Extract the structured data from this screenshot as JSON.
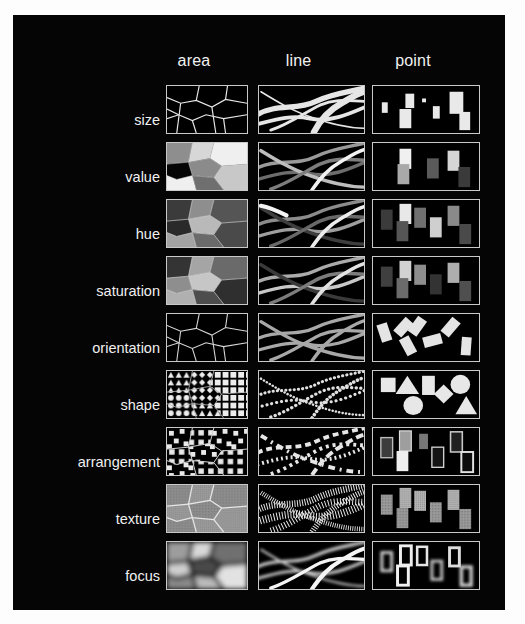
{
  "figure": {
    "background_color": "#ffffff",
    "board_color": "#050505",
    "border_color": "#c9c9c9",
    "text_color": "#f2f2f2"
  },
  "columns": [
    {
      "key": "area",
      "label": "area"
    },
    {
      "key": "line",
      "label": "line"
    },
    {
      "key": "point",
      "label": "point"
    }
  ],
  "rows": [
    {
      "key": "size",
      "label": "size"
    },
    {
      "key": "value",
      "label": "value"
    },
    {
      "key": "hue",
      "label": "hue"
    },
    {
      "key": "saturation",
      "label": "saturation"
    },
    {
      "key": "orientation",
      "label": "orientation"
    },
    {
      "key": "shape",
      "label": "shape"
    },
    {
      "key": "arrangement",
      "label": "arrangement"
    },
    {
      "key": "texture",
      "label": "texture"
    },
    {
      "key": "focus",
      "label": "focus"
    }
  ],
  "matrix": {
    "size": {
      "area": "irregular polygon mesh outlined in white on black, cells of differing sizes",
      "line": "crossing white ribbons of varying thickness",
      "point": "white rectangles of varying size scattered on black"
    },
    "value": {
      "area": "polygon mesh filled with light, mid and dark grey tones",
      "line": "crossing ribbons in light grey, mid grey and white",
      "point": "rectangles in white, light grey, mid grey and dark grey"
    },
    "hue": {
      "area": "polygon mesh filled with different hues rendered as greys",
      "line": "crossing ribbons in different hues rendered as greys",
      "point": "rectangles in different hues rendered as greys"
    },
    "saturation": {
      "area": "polygon mesh filled with varying saturation of one hue",
      "line": "crossing ribbons with varying saturation",
      "point": "rectangles with varying saturation"
    },
    "orientation": {
      "area": "polygon mesh with uniform light outlines",
      "line": "crossing grey ribbons of uniform width",
      "point": "identical light rectangles rotated to different angles"
    },
    "shape": {
      "area": "polygon mesh filled with repeating triangle, circle, diamond and square fill symbols",
      "line": "lines built from repeating small symbol markers",
      "point": "square, triangle, rectangle, circle, diamond shapes"
    },
    "arrangement": {
      "area": "polygon mesh filled with regular versus random dot arrangements",
      "line": "lines made of dashes with regular and irregular spacing",
      "point": "rectangles with regular and irregular internal arrangement"
    },
    "texture": {
      "area": "polygon mesh on a coarse grey textured ground",
      "line": "lines drawn with fine comb-like hatch texture",
      "point": "rectangles with coarse and fine grain textures"
    },
    "focus": {
      "area": "polygon mesh with blurred soft-edged glowing fills",
      "line": "ribbons with sharp and blurred soft edges",
      "point": "rectangles with sharp and blurred soft edges"
    }
  },
  "layout": {
    "column_x": [
      166,
      258,
      372
    ],
    "column_width": [
      82,
      107,
      108
    ],
    "header_y": 52,
    "first_row_y": 85,
    "row_pitch": 57,
    "row_height": 49,
    "label_right_x": 160
  }
}
